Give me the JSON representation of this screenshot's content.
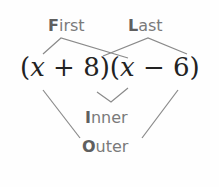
{
  "diagram": {
    "expression": {
      "text": "(x + 8)(x − 6)",
      "parts": [
        "(",
        "x",
        " + 8)(",
        "x",
        " − 6)"
      ]
    },
    "labels": {
      "first": {
        "initial": "F",
        "rest": "irst"
      },
      "last": {
        "initial": "L",
        "rest": "ast"
      },
      "inner": {
        "initial": "I",
        "rest": "nner"
      },
      "outer": {
        "initial": "O",
        "rest": "uter"
      }
    },
    "line_color": "#8a8a8a",
    "label_color": "#7a7a7a"
  }
}
